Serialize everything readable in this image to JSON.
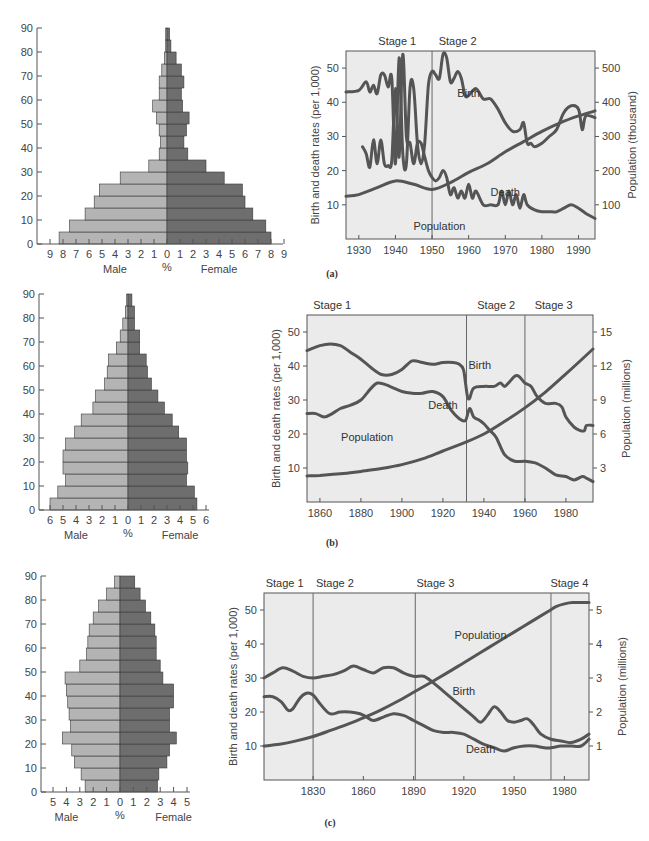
{
  "colors": {
    "male_bar": "#b4b4b4",
    "female_bar": "#6e6e6e",
    "bar_stroke": "#3a3a3a",
    "chart_bg": "#ebebeb",
    "line": "#555555",
    "axis": "#555555"
  },
  "chart_data": [
    {
      "id": "pyramid_a",
      "type": "bar",
      "subtype": "population-pyramid",
      "xlabel_left": "Male",
      "xlabel_center": "%",
      "xlabel_right": "Female",
      "yticks": [
        0,
        10,
        20,
        30,
        40,
        50,
        60,
        70,
        80,
        90
      ],
      "xticks": [
        9,
        8,
        7,
        6,
        5,
        4,
        3,
        2,
        1,
        0,
        1,
        2,
        3,
        4,
        5,
        6,
        7,
        8,
        9
      ],
      "xmax": 9,
      "age_groups": [
        "0-4",
        "5-9",
        "10-14",
        "15-19",
        "20-24",
        "25-29",
        "30-34",
        "35-39",
        "40-44",
        "45-49",
        "50-54",
        "55-59",
        "60-64",
        "65-69",
        "70-74",
        "75-79",
        "80-84",
        "85-89"
      ],
      "male": [
        8.3,
        7.5,
        6.3,
        5.6,
        5.2,
        3.6,
        1.4,
        0.6,
        0.5,
        0.6,
        0.8,
        1.1,
        0.6,
        0.6,
        0.4,
        0.2,
        0.1,
        0.1
      ],
      "female": [
        8.0,
        7.6,
        6.6,
        6.0,
        5.8,
        4.4,
        3.0,
        1.6,
        1.3,
        1.5,
        1.7,
        1.2,
        1.1,
        1.3,
        1.1,
        0.7,
        0.3,
        0.2
      ]
    },
    {
      "id": "rates_a",
      "type": "line",
      "panel_label": "(a)",
      "ylabel": "Birth and death rates (per 1,000)",
      "y2label": "Population (thousand)",
      "xticks": [
        1930,
        1940,
        1950,
        1960,
        1970,
        1980,
        1990
      ],
      "yticks": [
        10,
        20,
        30,
        40,
        50
      ],
      "y2ticks": [
        100,
        200,
        300,
        400,
        500
      ],
      "xlim": [
        1926.5,
        1994.5
      ],
      "ylim": [
        0,
        55
      ],
      "y2lim": [
        0,
        550
      ],
      "stages": [
        {
          "label": "Stage 1",
          "x_label": 1940.5
        },
        {
          "label": "Stage 2",
          "x_label": 1957
        }
      ],
      "stage_lines": [
        1950
      ],
      "series": [
        {
          "name": "Birth",
          "label_at": [
            1960,
            41.5
          ],
          "x": [
            1926.5,
            1930,
            1932,
            1933,
            1934,
            1935,
            1936,
            1937,
            1938,
            1939,
            1940,
            1941,
            1942,
            1943,
            1944,
            1945,
            1946,
            1947,
            1948,
            1949,
            1950,
            1951,
            1952,
            1953,
            1954,
            1955,
            1956,
            1957,
            1958,
            1959,
            1960,
            1962,
            1964,
            1966,
            1968,
            1970,
            1972,
            1974,
            1975,
            1976,
            1977,
            1978,
            1980,
            1982,
            1984,
            1986,
            1988,
            1990,
            1991,
            1992,
            1994.5
          ],
          "y": [
            43,
            43.5,
            46,
            43,
            45,
            42.5,
            48,
            48,
            44.5,
            47,
            22,
            53,
            25,
            22,
            44.5,
            44,
            28,
            22,
            28,
            45,
            49,
            48,
            47,
            54,
            53,
            46,
            47,
            49,
            47,
            42,
            42,
            44,
            41,
            41,
            38,
            34,
            31.5,
            32,
            34,
            28,
            28,
            27,
            28,
            30,
            32,
            37,
            39,
            38,
            32,
            36,
            35.5
          ]
        },
        {
          "name": "Death",
          "label_at": [
            1970,
            12.5
          ],
          "x": [
            1931,
            1932,
            1933,
            1934,
            1935,
            1936,
            1937,
            1938,
            1939,
            1940,
            1941,
            1942,
            1943,
            1944,
            1945,
            1946,
            1947,
            1948,
            1949,
            1950,
            1951,
            1952,
            1953,
            1954,
            1955,
            1956,
            1957,
            1958,
            1959,
            1960,
            1961,
            1962,
            1964,
            1966,
            1968,
            1969,
            1970,
            1971,
            1972,
            1973,
            1974,
            1975,
            1976,
            1978,
            1980,
            1982,
            1984,
            1986,
            1988,
            1990,
            1992,
            1994.5
          ],
          "y": [
            27,
            25,
            21,
            29,
            22,
            29,
            22,
            21.5,
            23,
            44,
            24,
            54,
            30,
            28,
            22,
            28,
            28,
            24,
            20,
            18,
            17,
            18,
            20,
            18,
            13,
            15,
            12,
            14,
            12,
            16,
            12,
            14,
            10,
            10,
            10,
            14,
            10,
            14,
            10,
            13,
            9,
            13,
            10,
            8.5,
            8,
            8,
            8,
            9,
            10,
            9,
            7.5,
            6
          ]
        },
        {
          "name": "Population",
          "axis": "right",
          "label_at": [
            1952,
            27
          ],
          "x": [
            1926.5,
            1930,
            1935,
            1940,
            1945,
            1950,
            1955,
            1960,
            1965,
            1970,
            1975,
            1980,
            1985,
            1990,
            1994.5
          ],
          "y": [
            125,
            130,
            150,
            170,
            160,
            145,
            165,
            195,
            220,
            255,
            285,
            315,
            340,
            360,
            375
          ]
        }
      ]
    },
    {
      "id": "pyramid_b",
      "type": "bar",
      "subtype": "population-pyramid",
      "xlabel_left": "Male",
      "xlabel_center": "%",
      "xlabel_right": "Female",
      "yticks": [
        0,
        10,
        20,
        30,
        40,
        50,
        60,
        70,
        80,
        90
      ],
      "xticks": [
        6,
        5,
        4,
        3,
        2,
        1,
        0,
        1,
        2,
        3,
        4,
        5,
        6
      ],
      "xmax": 6,
      "age_groups": [
        "0-4",
        "5-9",
        "10-14",
        "15-19",
        "20-24",
        "25-29",
        "30-34",
        "35-39",
        "40-44",
        "45-49",
        "50-54",
        "55-59",
        "60-64",
        "65-69",
        "70-74",
        "75-79",
        "80-84",
        "85-89"
      ],
      "male": [
        6.0,
        5.4,
        4.8,
        5.0,
        5.0,
        4.8,
        4.1,
        3.6,
        2.7,
        2.5,
        1.8,
        1.6,
        1.5,
        0.9,
        0.6,
        0.4,
        0.2,
        0.1
      ],
      "female": [
        5.3,
        5.1,
        4.5,
        4.6,
        4.5,
        4.5,
        3.9,
        3.4,
        2.8,
        2.3,
        1.8,
        1.5,
        1.4,
        0.9,
        0.9,
        0.5,
        0.5,
        0.3
      ]
    },
    {
      "id": "rates_b",
      "type": "line",
      "panel_label": "(b)",
      "ylabel": "Birth and death rates (per 1,000)",
      "y2label": "Population (millions)",
      "xticks": [
        1860,
        1880,
        1900,
        1920,
        1940,
        1960,
        1980
      ],
      "yticks": [
        10,
        20,
        30,
        40,
        50
      ],
      "y2ticks": [
        3,
        6,
        9,
        12,
        15
      ],
      "xlim": [
        1853.7,
        1993.2
      ],
      "ylim": [
        0,
        55
      ],
      "y2lim": [
        0,
        16.5
      ],
      "stages": [
        {
          "label": "Stage 1",
          "x_label": 1866
        },
        {
          "label": "Stage 2",
          "x_label": 1946
        },
        {
          "label": "Stage 3",
          "x_label": 1974
        }
      ],
      "stage_lines": [
        1931.5,
        1960
      ],
      "series": [
        {
          "name": "Birth",
          "label_at": [
            1938,
            39
          ],
          "x": [
            1853.7,
            1860,
            1865,
            1870,
            1875,
            1880,
            1885,
            1890,
            1895,
            1900,
            1905,
            1910,
            1915,
            1920,
            1925,
            1928,
            1930,
            1931,
            1932,
            1933,
            1935,
            1940,
            1945,
            1948,
            1950,
            1952,
            1955,
            1957,
            1960,
            1963,
            1966,
            1970,
            1975,
            1978,
            1980,
            1984,
            1987,
            1989,
            1990,
            1993.2
          ],
          "y": [
            44.5,
            46,
            46.5,
            46,
            44,
            42,
            39.5,
            37.5,
            37.5,
            39,
            41.5,
            41,
            40.5,
            41,
            41,
            40.5,
            39,
            35,
            31,
            30.5,
            33.5,
            34,
            34,
            35,
            34,
            35,
            37,
            37,
            35,
            34,
            31,
            29,
            29,
            28,
            25,
            22,
            21,
            21,
            22.5,
            22.5
          ]
        },
        {
          "name": "Death",
          "label_at": [
            1920,
            27.5
          ],
          "x": [
            1853.7,
            1858,
            1862,
            1866,
            1870,
            1875,
            1880,
            1885,
            1888,
            1892,
            1896,
            1900,
            1905,
            1910,
            1915,
            1920,
            1924,
            1928,
            1931,
            1933,
            1935,
            1938,
            1940,
            1943,
            1946,
            1950,
            1955,
            1960,
            1965,
            1970,
            1975,
            1980,
            1984,
            1988,
            1990,
            1993.2
          ],
          "y": [
            26,
            26,
            25,
            26,
            27.5,
            28.5,
            30,
            33.5,
            35,
            34.5,
            33.5,
            32.5,
            32,
            32,
            32.5,
            31,
            27,
            24.5,
            24,
            27.5,
            25,
            24,
            23,
            21,
            19,
            14,
            12,
            12,
            11.5,
            10,
            8,
            7.5,
            6.5,
            7.5,
            7,
            6
          ]
        },
        {
          "name": "Population",
          "axis": "right",
          "label_at": [
            1883,
            5.4
          ],
          "x": [
            1853.7,
            1860,
            1870,
            1880,
            1890,
            1900,
            1910,
            1920,
            1930,
            1940,
            1950,
            1960,
            1970,
            1980,
            1993.2
          ],
          "y": [
            2.3,
            2.35,
            2.5,
            2.7,
            2.95,
            3.3,
            3.8,
            4.5,
            5.2,
            6.0,
            7.1,
            8.3,
            9.7,
            11.3,
            13.5
          ]
        }
      ]
    },
    {
      "id": "pyramid_c",
      "type": "bar",
      "subtype": "population-pyramid",
      "xlabel_left": "Male",
      "xlabel_center": "%",
      "xlabel_right": "Female",
      "yticks": [
        0,
        10,
        20,
        30,
        40,
        50,
        60,
        70,
        80,
        90
      ],
      "xticks": [
        5,
        4,
        3,
        2,
        1,
        0,
        1,
        2,
        3,
        4,
        5
      ],
      "xmax": 5,
      "age_groups": [
        "0-4",
        "5-9",
        "10-14",
        "15-19",
        "20-24",
        "25-29",
        "30-34",
        "35-39",
        "40-44",
        "45-49",
        "50-54",
        "55-59",
        "60-64",
        "65-69",
        "70-74",
        "75-79",
        "80-84",
        "85-89"
      ],
      "male": [
        2.6,
        2.9,
        3.4,
        3.6,
        4.3,
        3.7,
        3.8,
        3.9,
        4.0,
        4.1,
        3.0,
        2.5,
        2.4,
        2.3,
        2.0,
        1.6,
        1.0,
        0.4
      ],
      "female": [
        2.8,
        2.9,
        3.5,
        3.7,
        4.2,
        3.7,
        3.7,
        4.0,
        4.0,
        3.2,
        3.0,
        2.7,
        2.7,
        2.6,
        2.3,
        1.9,
        1.5,
        1.1
      ]
    },
    {
      "id": "rates_c",
      "type": "line",
      "panel_label": "(c)",
      "ylabel": "Birth and death rates (per 1,000)",
      "y2label": "Population (millions)",
      "xticks": [
        1830,
        1860,
        1890,
        1920,
        1950,
        1980
      ],
      "yticks": [
        10,
        20,
        30,
        40,
        50
      ],
      "y2ticks": [
        1,
        2,
        3,
        4,
        5
      ],
      "xlim": [
        1800.7,
        1994.7
      ],
      "ylim": [
        0,
        55
      ],
      "y2lim": [
        0,
        5.5
      ],
      "stages": [
        {
          "label": "Stage 1",
          "x_label": 1813
        },
        {
          "label": "Stage 2",
          "x_label": 1843
        },
        {
          "label": "Stage 3",
          "x_label": 1903
        },
        {
          "label": "Stage 4",
          "x_label": 1983
        }
      ],
      "stage_lines": [
        1830,
        1891,
        1972
      ],
      "series": [
        {
          "name": "Birth",
          "label_at": [
            1920,
            25
          ],
          "x": [
            1800.7,
            1806,
            1812,
            1818,
            1824,
            1830,
            1836,
            1842,
            1848,
            1854,
            1860,
            1866,
            1872,
            1878,
            1884,
            1890,
            1896,
            1902,
            1908,
            1914,
            1920,
            1926,
            1930,
            1934,
            1938,
            1942,
            1946,
            1950,
            1954,
            1958,
            1962,
            1966,
            1972,
            1978,
            1984,
            1990,
            1994.7
          ],
          "y": [
            30,
            31.5,
            33,
            32,
            30.5,
            30,
            30.5,
            31,
            32,
            33.5,
            32.5,
            31.5,
            33,
            33,
            31.5,
            30.5,
            30.5,
            28.5,
            26,
            23.5,
            21,
            18.5,
            17,
            19,
            21.5,
            20,
            17.5,
            17,
            17.5,
            18,
            16,
            13.5,
            12,
            11.5,
            11,
            12,
            13.5
          ]
        },
        {
          "name": "Death",
          "label_at": [
            1930,
            8
          ],
          "x": [
            1800.7,
            1806,
            1811,
            1815,
            1818,
            1822,
            1826,
            1830,
            1834,
            1840,
            1846,
            1852,
            1858,
            1862,
            1866,
            1872,
            1878,
            1884,
            1890,
            1896,
            1902,
            1908,
            1914,
            1920,
            1926,
            1932,
            1938,
            1944,
            1950,
            1956,
            1962,
            1968,
            1972,
            1978,
            1984,
            1990,
            1994.7
          ],
          "y": [
            24.5,
            24.5,
            23,
            20.5,
            21,
            24,
            25.5,
            25,
            22.5,
            19.5,
            20,
            20,
            19.5,
            18.5,
            17.5,
            18.5,
            19.5,
            19,
            17.5,
            16,
            14.5,
            14,
            14,
            13.5,
            12,
            10.5,
            9.5,
            8.5,
            9.5,
            10,
            10,
            9.5,
            9.5,
            10,
            10,
            10,
            12
          ]
        },
        {
          "name": "Population",
          "axis": "right",
          "label_at": [
            1930,
            4.15
          ],
          "x": [
            1800.7,
            1810,
            1820,
            1830,
            1840,
            1850,
            1860,
            1870,
            1880,
            1890,
            1900,
            1910,
            1920,
            1930,
            1940,
            1950,
            1960,
            1970,
            1975,
            1980,
            1985,
            1994.7
          ],
          "y": [
            1.0,
            1.05,
            1.15,
            1.28,
            1.45,
            1.63,
            1.83,
            2.05,
            2.3,
            2.58,
            2.86,
            3.15,
            3.45,
            3.75,
            4.05,
            4.35,
            4.65,
            4.95,
            5.1,
            5.18,
            5.22,
            5.22
          ]
        }
      ]
    }
  ]
}
